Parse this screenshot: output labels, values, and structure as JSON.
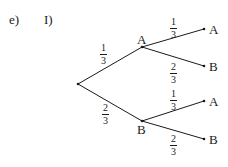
{
  "header": {
    "part_label": "e)",
    "sub_label": "I)"
  },
  "tree": {
    "root": {
      "x": 78,
      "y": 84
    },
    "level1": [
      {
        "label": "A",
        "x": 142,
        "y": 47,
        "prob": {
          "num": "1",
          "den": "3"
        }
      },
      {
        "label": "B",
        "x": 142,
        "y": 121,
        "prob": {
          "num": "2",
          "den": "3"
        }
      }
    ],
    "level2": [
      {
        "parent": "A",
        "label": "A",
        "x": 204,
        "y": 29,
        "prob": {
          "num": "1",
          "den": "3"
        }
      },
      {
        "parent": "A",
        "label": "B",
        "x": 204,
        "y": 66,
        "prob": {
          "num": "2",
          "den": "3"
        }
      },
      {
        "parent": "B",
        "label": "A",
        "x": 204,
        "y": 101,
        "prob": {
          "num": "1",
          "den": "3"
        }
      },
      {
        "parent": "B",
        "label": "B",
        "x": 204,
        "y": 139,
        "prob": {
          "num": "2",
          "den": "3"
        }
      }
    ]
  },
  "colors": {
    "ink": "#1a1a1a",
    "background": "#ffffff"
  }
}
